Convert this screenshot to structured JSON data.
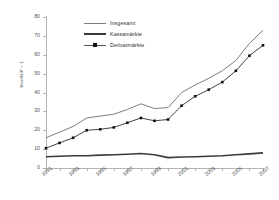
{
  "chart_data": {
    "type": "line",
    "title": "",
    "xlabel": "",
    "ylabel": "Wert/BIP = 1",
    "xlim": [
      1991,
      2007
    ],
    "ylim": [
      0,
      80
    ],
    "grid": false,
    "legend_position": "top-left-inside",
    "x": [
      1991,
      1992,
      1993,
      1994,
      1995,
      1996,
      1997,
      1998,
      1999,
      2000,
      2001,
      2002,
      2003,
      2004,
      2005,
      2006,
      2007
    ],
    "xtick_labels": [
      "1991",
      "1993",
      "1995",
      "1997",
      "1999",
      "2001",
      "2003",
      "2005",
      "2007"
    ],
    "xtick_values": [
      1991,
      1993,
      1995,
      1997,
      1999,
      2001,
      2003,
      2005,
      2007
    ],
    "ytick_labels": [
      "0",
      "10",
      "20",
      "30",
      "40",
      "50",
      "60",
      "70",
      "80"
    ],
    "ytick_values": [
      0,
      10,
      20,
      30,
      40,
      50,
      60,
      70,
      80
    ],
    "series": [
      {
        "name": "Insgesamt",
        "marker": "none",
        "color": "#7d7d7d",
        "width": 1,
        "values": [
          16,
          19,
          22,
          26.5,
          27.5,
          28.5,
          31,
          34,
          31.5,
          32,
          40,
          44,
          47.5,
          51.5,
          57,
          66,
          73
        ]
      },
      {
        "name": "Kassamärkte",
        "marker": "none",
        "color": "#3a3a3a",
        "width": 1.6,
        "values": [
          6,
          6.2,
          6.5,
          6.5,
          6.8,
          7,
          7.3,
          7.7,
          7,
          5.5,
          5.8,
          6,
          6.2,
          6.5,
          7,
          7.5,
          8
        ]
      },
      {
        "name": "Derivatmärkte",
        "marker": "square",
        "color": "#444444",
        "width": 1,
        "values": [
          10.5,
          13.3,
          16,
          20,
          20.5,
          21.5,
          24,
          26.5,
          25,
          25.7,
          33,
          38,
          41.5,
          45.5,
          51.5,
          59.5,
          65
        ]
      }
    ]
  },
  "legend": {
    "items": [
      {
        "label": "Insgesamt"
      },
      {
        "label": "Kassamärkte"
      },
      {
        "label": "Derivatmärkte"
      }
    ]
  },
  "axes": {
    "y_title": "Wert/BIP = 1"
  }
}
